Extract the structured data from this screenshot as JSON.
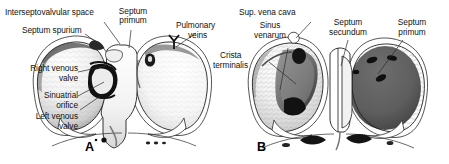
{
  "figure": {
    "type": "anatomical-illustration",
    "background_color": "#ffffff",
    "ink_color": "#000000",
    "panels": [
      {
        "id": "A",
        "id_label": "A",
        "side": "left",
        "fill_left_chamber": "#f2f2f2",
        "fill_right_chamber": "#fafafa",
        "labels": [
          {
            "key": "interseptovalvular_space",
            "text": "Interseptovalvular space"
          },
          {
            "key": "septum_spurium",
            "text": "Septum spurium"
          },
          {
            "key": "septum_primum",
            "text": "Septum\nprimum"
          },
          {
            "key": "pulmonary_veins",
            "text": "Pulmonary\nveins"
          },
          {
            "key": "right_venous_valve",
            "text": "Right venous\nvalve"
          },
          {
            "key": "sinuatrial_orifice",
            "text": "Sinuatrial\norifice"
          },
          {
            "key": "left_venous_valve",
            "text": "Left venous\nvalve"
          }
        ]
      },
      {
        "id": "B",
        "id_label": "B",
        "side": "right",
        "fill_left_chamber": "#f4f4f4",
        "fill_right_chamber": "#5e5e5e",
        "labels": [
          {
            "key": "sup_vena_cava",
            "text": "Sup. vena cava"
          },
          {
            "key": "sinus_venarum",
            "text": "Sinus\nvenarum"
          },
          {
            "key": "crista_terminalis",
            "text": "Crista\nterminalis"
          },
          {
            "key": "septum_secundum",
            "text": "Septum\nsecundum"
          },
          {
            "key": "septum_primum_b",
            "text": "Septum\nprimum"
          }
        ]
      }
    ]
  },
  "labels": {
    "a_interseptovalvular_space": "Interseptovalvular space",
    "a_septum_spurium": "Septum spurium",
    "a_septum_primum_l1": "Septum",
    "a_septum_primum_l2": "primum",
    "a_pulmonary_veins_l1": "Pulmonary",
    "a_pulmonary_veins_l2": "veins",
    "a_right_venous_valve_l1": "Right venous",
    "a_right_venous_valve_l2": "valve",
    "a_sinuatrial_orifice_l1": "Sinuatrial",
    "a_sinuatrial_orifice_l2": "orifice",
    "a_left_venous_valve_l1": "Left venous",
    "a_left_venous_valve_l2": "valve",
    "b_sup_vena_cava": "Sup. vena cava",
    "b_sinus_venarum_l1": "Sinus",
    "b_sinus_venarum_l2": "venarum",
    "b_crista_terminalis_l1": "Crista",
    "b_crista_terminalis_l2": "terminalis",
    "b_septum_secundum_l1": "Septum",
    "b_septum_secundum_l2": "secundum",
    "b_septum_primum_l1": "Septum",
    "b_septum_primum_l2": "primum",
    "panel_a_id": "A",
    "panel_b_id": "B"
  },
  "colors": {
    "background": "#ffffff",
    "outline": "#1a1a1a",
    "leader_line": "#2a2a2a",
    "text": "#111111",
    "dark_chamber": "#5e5e5e",
    "shade_light": "#eaeaea",
    "shade_mid": "#b8b8b8",
    "shade_dark": "#3a3a3a"
  }
}
